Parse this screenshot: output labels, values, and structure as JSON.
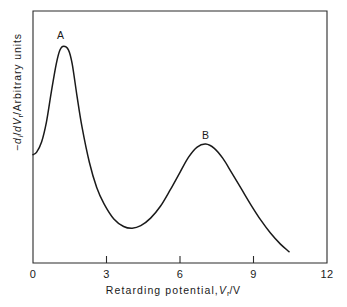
{
  "figure": {
    "background_color": "#ffffff",
    "line_color": "#1a1a1a"
  },
  "chart_data": {
    "type": "line",
    "title": "",
    "subtitle": "",
    "xlabel_parts": {
      "text_before": "Retarding potential,",
      "symbol": "V",
      "subscript": "r",
      "unit_separator": "/",
      "unit": "V"
    },
    "ylabel_parts": {
      "minus": "−",
      "d1": "d",
      "sub1": "i",
      "slash1": "/",
      "d2": "d",
      "symbol": "V",
      "sub2": "r",
      "slash2": "/",
      "text_after": "Arbitrary units"
    },
    "xlabel": "Retarding potential, Vr / V",
    "ylabel": "-di/dVr / Arbitrary units",
    "xlim": [
      0,
      12
    ],
    "ylim": [
      0,
      1
    ],
    "xticks": [
      0,
      3,
      6,
      9,
      12
    ],
    "xtick_labels": [
      "0",
      "3",
      "6",
      "9",
      "12"
    ],
    "yticks": [],
    "ytick_labels": [],
    "grid": false,
    "legend": null,
    "annotations": [
      {
        "label": "A",
        "x": 1.2,
        "y": 0.89,
        "note": "first peak maximum"
      },
      {
        "label": "B",
        "x": 7.0,
        "y": 0.5,
        "note": "second peak maximum"
      }
    ],
    "series": [
      {
        "name": "-di/dVr",
        "points": [
          {
            "x": 0.0,
            "y": 0.43
          },
          {
            "x": 0.15,
            "y": 0.44
          },
          {
            "x": 0.35,
            "y": 0.48
          },
          {
            "x": 0.55,
            "y": 0.56
          },
          {
            "x": 0.75,
            "y": 0.68
          },
          {
            "x": 0.95,
            "y": 0.79
          },
          {
            "x": 1.1,
            "y": 0.845
          },
          {
            "x": 1.25,
            "y": 0.86
          },
          {
            "x": 1.45,
            "y": 0.845
          },
          {
            "x": 1.6,
            "y": 0.79
          },
          {
            "x": 1.8,
            "y": 0.66
          },
          {
            "x": 2.0,
            "y": 0.54
          },
          {
            "x": 2.3,
            "y": 0.4
          },
          {
            "x": 2.6,
            "y": 0.3
          },
          {
            "x": 2.9,
            "y": 0.235
          },
          {
            "x": 3.3,
            "y": 0.175
          },
          {
            "x": 3.7,
            "y": 0.145
          },
          {
            "x": 4.05,
            "y": 0.138
          },
          {
            "x": 4.4,
            "y": 0.148
          },
          {
            "x": 4.8,
            "y": 0.178
          },
          {
            "x": 5.2,
            "y": 0.225
          },
          {
            "x": 5.6,
            "y": 0.29
          },
          {
            "x": 6.0,
            "y": 0.36
          },
          {
            "x": 6.35,
            "y": 0.42
          },
          {
            "x": 6.7,
            "y": 0.46
          },
          {
            "x": 7.05,
            "y": 0.472
          },
          {
            "x": 7.4,
            "y": 0.455
          },
          {
            "x": 7.75,
            "y": 0.415
          },
          {
            "x": 8.1,
            "y": 0.36
          },
          {
            "x": 8.5,
            "y": 0.295
          },
          {
            "x": 8.9,
            "y": 0.23
          },
          {
            "x": 9.3,
            "y": 0.17
          },
          {
            "x": 9.7,
            "y": 0.118
          },
          {
            "x": 10.1,
            "y": 0.075
          },
          {
            "x": 10.45,
            "y": 0.045
          }
        ]
      }
    ]
  }
}
